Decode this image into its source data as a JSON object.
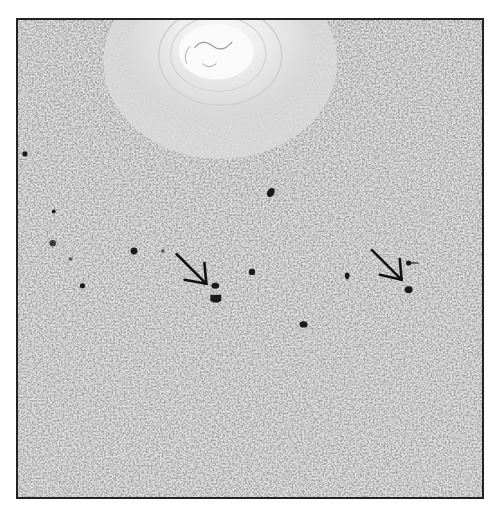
{
  "figure": {
    "type": "grayscale histology micrograph",
    "frame_color": "#222222",
    "background_color": "#dcdcdc",
    "stain_color": "#1a1a1a",
    "annotations": [
      {
        "type": "arrow",
        "direction": "down-right",
        "tip_x": 208,
        "tip_y": 286
      },
      {
        "type": "arrow",
        "direction": "down-right",
        "tip_x": 404,
        "tip_y": 283
      }
    ],
    "stained_cells": [
      {
        "x": 272,
        "y": 193,
        "r": 4
      },
      {
        "x": 134,
        "y": 252,
        "r": 4
      },
      {
        "x": 253,
        "y": 273,
        "r": 3.5
      },
      {
        "x": 216,
        "y": 287,
        "r": 3.5
      },
      {
        "x": 216,
        "y": 300,
        "r": 5
      },
      {
        "x": 82,
        "y": 287,
        "r": 3
      },
      {
        "x": 349,
        "y": 277,
        "r": 3
      },
      {
        "x": 412,
        "y": 264,
        "r": 3
      },
      {
        "x": 411,
        "y": 291,
        "r": 4.5
      },
      {
        "x": 305,
        "y": 326,
        "r": 4
      },
      {
        "x": 52,
        "y": 244,
        "r": 3.5
      },
      {
        "x": 24,
        "y": 154,
        "r": 3
      },
      {
        "x": 53,
        "y": 212,
        "r": 2.5
      }
    ]
  }
}
